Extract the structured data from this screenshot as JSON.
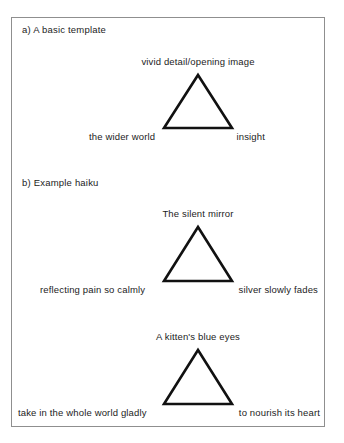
{
  "figure": {
    "sections": [
      {
        "label": "a) A basic template",
        "label_x": 22,
        "label_y": 24,
        "triangles": [
          {
            "apex_label": "vivid detail/opening image",
            "base_left_label": "the wider world",
            "base_right_label": "insight",
            "apex_x": 198,
            "apex_y": 75,
            "base_y": 128,
            "half_width": 34,
            "apex_label_y": 56,
            "base_label_y": 131,
            "base_left_label_x": 89,
            "base_right_label_x": 265
          }
        ]
      },
      {
        "label": "b) Example haiku",
        "label_x": 22,
        "label_y": 177,
        "triangles": [
          {
            "apex_label": "The silent mirror",
            "base_left_label": "reflecting pain so calmly",
            "base_right_label": "silver slowly fades",
            "apex_x": 198,
            "apex_y": 227,
            "base_y": 281,
            "half_width": 34,
            "apex_label_y": 208,
            "base_label_y": 284,
            "base_left_label_x": 40,
            "base_right_label_x": 318
          },
          {
            "apex_label": "A kitten's blue eyes",
            "base_left_label": "take in the whole world gladly",
            "base_right_label": "to nourish its heart",
            "apex_x": 198,
            "apex_y": 350,
            "base_y": 404,
            "half_width": 34,
            "apex_label_y": 331,
            "base_label_y": 407,
            "base_left_label_x": 18,
            "base_right_label_x": 320
          }
        ]
      }
    ],
    "style": {
      "triangle_stroke_color": "#111111",
      "triangle_stroke_width": 2.6,
      "frame_border_color": "#8f8f8f",
      "text_color": "#1c1c1c",
      "background": "#ffffff"
    }
  }
}
